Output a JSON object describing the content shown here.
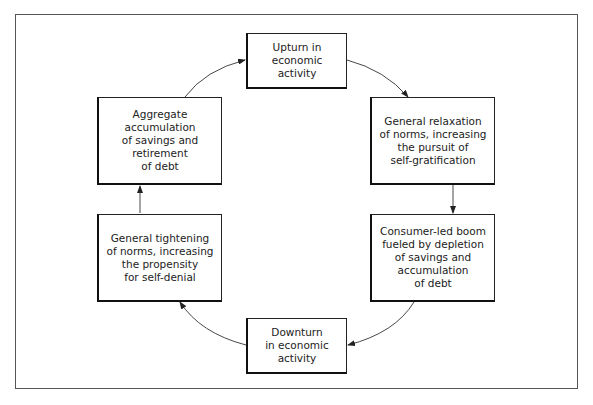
{
  "diagram": {
    "type": "cycle",
    "nodes": [
      {
        "id": "upturn",
        "label": "Upturn in\neconomic\nactivity"
      },
      {
        "id": "relaxation",
        "label": "General relaxation\nof norms, increasing\nthe pursuit of\nself-gratification"
      },
      {
        "id": "boom",
        "label": "Consumer-led boom\nfueled by depletion\nof savings and\naccumulation\nof debt"
      },
      {
        "id": "downturn",
        "label": "Downturn\nin economic\nactivity"
      },
      {
        "id": "tightening",
        "label": "General tightening\nof norms, increasing\nthe propensity\nfor self-denial"
      },
      {
        "id": "aggregate",
        "label": "Aggregate\naccumulation\nof savings and\nretirement\nof debt"
      }
    ],
    "edges": [
      {
        "from": "upturn",
        "to": "relaxation"
      },
      {
        "from": "relaxation",
        "to": "boom"
      },
      {
        "from": "boom",
        "to": "downturn"
      },
      {
        "from": "downturn",
        "to": "tightening"
      },
      {
        "from": "tightening",
        "to": "aggregate"
      },
      {
        "from": "aggregate",
        "to": "upturn"
      }
    ]
  }
}
